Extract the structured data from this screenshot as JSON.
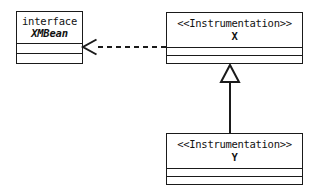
{
  "diagram": {
    "type": "uml-class-diagram",
    "background_color": "#ffffff",
    "line_color": "#1a1a1a",
    "text_color": "#111111"
  },
  "classes": {
    "xmbean": {
      "keyword": "interface",
      "name": "XMBean",
      "compartments": 3
    },
    "x": {
      "stereotype": "<<Instrumentation>>",
      "name": "X",
      "compartments": 3
    },
    "y": {
      "stereotype": "<<Instrumentation>>",
      "name": "Y",
      "compartments": 3
    }
  },
  "relationships": {
    "realization": {
      "label": "",
      "from": "X",
      "to": "XMBean",
      "style": "dashed",
      "arrowhead": "open"
    },
    "generalization": {
      "label": "",
      "from": "Y",
      "to": "X",
      "style": "solid",
      "arrowhead": "hollow-triangle"
    }
  }
}
